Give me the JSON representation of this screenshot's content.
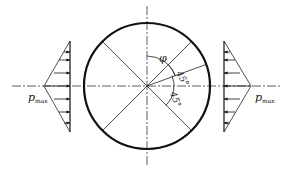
{
  "diagram": {
    "type": "bearing-pressure-distribution",
    "colors": {
      "stroke": "#1a1a1a",
      "background": "#ffffff"
    },
    "labels": {
      "phi": "φ",
      "angle_upper": "45°",
      "angle_lower": "45°",
      "pmax_left_main": "p",
      "pmax_left_sub": "max",
      "pmax_right_main": "p",
      "pmax_right_sub": "max"
    }
  }
}
